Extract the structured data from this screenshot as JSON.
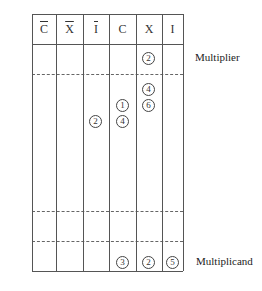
{
  "diagram": {
    "columns": [
      {
        "label": "C",
        "overline": true
      },
      {
        "label": "X",
        "overline": true
      },
      {
        "label": "I",
        "overline": true
      },
      {
        "label": "C",
        "overline": false
      },
      {
        "label": "X",
        "overline": false
      },
      {
        "label": "I",
        "overline": false
      }
    ],
    "labels": {
      "multiplier": "Multiplier",
      "multiplicand": "Multiplicand"
    },
    "circled_numbers": {
      "multiplier_x": "2",
      "partial_x_top": "4",
      "partial_c_top": "1",
      "partial_x_bottom": "6",
      "partial_i_bar": "2",
      "partial_c_bottom": "4",
      "multiplicand_c": "3",
      "multiplicand_x": "2",
      "multiplicand_i": "5"
    }
  }
}
